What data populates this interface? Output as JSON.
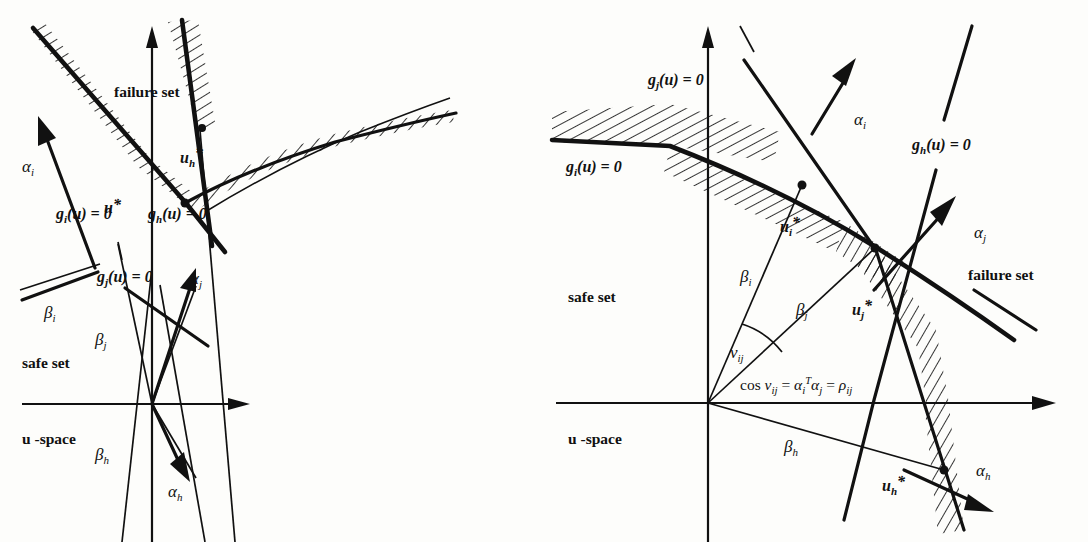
{
  "figure": {
    "caption_absent": true,
    "panels": [
      {
        "id": "left",
        "name": "left-panel",
        "space_label": "u -space",
        "region_labels": {
          "failure": "failure set",
          "safe": "safe set"
        },
        "limit_state_labels": [
          {
            "key": "gi",
            "base": "g",
            "sub": "i",
            "rest": "(u) = 0"
          },
          {
            "key": "gj",
            "base": "g",
            "sub": "j",
            "rest": "(u) = 0"
          },
          {
            "key": "gh",
            "base": "g",
            "sub": "h",
            "rest": "(u) = 0"
          }
        ],
        "design_points": [
          {
            "key": "ustar",
            "base": "u",
            "sub": "",
            "star": "*"
          },
          {
            "key": "uhstar",
            "base": "u",
            "sub": "h",
            "star": "*"
          }
        ],
        "alpha_vectors": [
          {
            "key": "alpha_i",
            "base": "α",
            "sub": "i"
          },
          {
            "key": "alpha_j",
            "base": "α",
            "sub": "j"
          },
          {
            "key": "alpha_h",
            "base": "α",
            "sub": "h"
          }
        ],
        "beta_distances": [
          {
            "key": "beta_i",
            "base": "β",
            "sub": "i"
          },
          {
            "key": "beta_j",
            "base": "β",
            "sub": "j"
          },
          {
            "key": "beta_h",
            "base": "β",
            "sub": "h"
          }
        ]
      },
      {
        "id": "right",
        "name": "right-panel",
        "space_label": "u -space",
        "region_labels": {
          "failure": "failure set",
          "safe": "safe set"
        },
        "limit_state_labels": [
          {
            "key": "gi",
            "base": "g",
            "sub": "i",
            "rest": "(u) = 0"
          },
          {
            "key": "gj",
            "base": "g",
            "sub": "j",
            "rest": "(u) = 0"
          },
          {
            "key": "gh",
            "base": "g",
            "sub": "h",
            "rest": "(u) = 0"
          }
        ],
        "design_points": [
          {
            "key": "uistar",
            "base": "u",
            "sub": "i",
            "star": "*"
          },
          {
            "key": "ujstar",
            "base": "u",
            "sub": "j",
            "star": "*"
          },
          {
            "key": "uhstar",
            "base": "u",
            "sub": "h",
            "star": "*"
          }
        ],
        "alpha_vectors": [
          {
            "key": "alpha_i",
            "base": "α",
            "sub": "i"
          },
          {
            "key": "alpha_j",
            "base": "α",
            "sub": "j"
          },
          {
            "key": "alpha_h",
            "base": "α",
            "sub": "h"
          }
        ],
        "beta_distances": [
          {
            "key": "beta_i",
            "base": "β",
            "sub": "i"
          },
          {
            "key": "beta_j",
            "base": "β",
            "sub": "j"
          },
          {
            "key": "beta_h",
            "base": "β",
            "sub": "h"
          }
        ],
        "angle_label": {
          "base": "ν",
          "sub": "ij"
        },
        "correlation_formula": {
          "lhs_cos": "cos",
          "nu": "ν",
          "nu_sub": "ij",
          "eq1": "=",
          "alpha": "α",
          "alpha_i_sub": "i",
          "sup_T": "T",
          "alpha2": "α",
          "alpha_j_sub": "j",
          "eq2": "=",
          "rho": "ρ",
          "rho_sub": "ij",
          "plain": "cos νᵢⱼ = αᵢᵀαⱼ = ρᵢⱼ"
        }
      }
    ]
  },
  "colors": {
    "ink": "#111111",
    "paper": "#fdfdfb"
  }
}
